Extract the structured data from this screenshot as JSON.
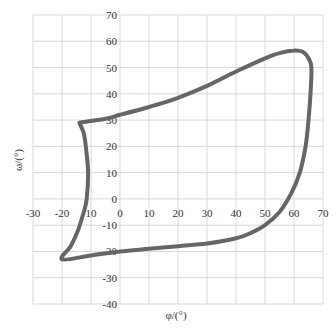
{
  "chart_data": {
    "type": "line",
    "title": "",
    "xlabel": "φ/(°)",
    "ylabel": "ω/(°)",
    "xlim": [
      -30,
      70
    ],
    "ylim": [
      -40,
      70
    ],
    "xticks": [
      -30,
      -20,
      -10,
      0,
      10,
      20,
      30,
      40,
      50,
      60,
      70
    ],
    "yticks": [
      -40,
      -30,
      -20,
      -10,
      0,
      10,
      20,
      30,
      40,
      50,
      60,
      70
    ],
    "xtick_labels": [
      "-30",
      "-20",
      "10",
      "0",
      "10",
      "20",
      "30",
      "40",
      "50",
      "60",
      "70"
    ],
    "ytick_labels": [
      "-40",
      "-30",
      "-20",
      "-10",
      "0",
      "10",
      "20",
      "30",
      "40",
      "50",
      "60",
      "70"
    ],
    "grid": true,
    "legend": null,
    "series": [
      {
        "name": "closed loop",
        "color": "#666666",
        "closed": true,
        "points": [
          [
            -14,
            29
          ],
          [
            -5,
            30.5
          ],
          [
            0,
            32
          ],
          [
            10,
            35
          ],
          [
            20,
            38.5
          ],
          [
            30,
            43
          ],
          [
            40,
            48.5
          ],
          [
            50,
            53.5
          ],
          [
            55,
            55.5
          ],
          [
            60,
            56.5
          ],
          [
            63,
            56
          ],
          [
            65,
            53.5
          ],
          [
            66,
            50
          ],
          [
            65.7,
            40
          ],
          [
            65,
            30
          ],
          [
            64,
            20
          ],
          [
            62,
            10
          ],
          [
            59,
            2
          ],
          [
            55,
            -5
          ],
          [
            50,
            -10
          ],
          [
            45,
            -13
          ],
          [
            40,
            -15
          ],
          [
            30,
            -17
          ],
          [
            20,
            -18
          ],
          [
            10,
            -19
          ],
          [
            0,
            -20
          ],
          [
            -10,
            -21.5
          ],
          [
            -20,
            -23
          ],
          [
            -17,
            -18
          ],
          [
            -14.5,
            -12
          ],
          [
            -12.5,
            -5
          ],
          [
            -11.5,
            0
          ],
          [
            -11,
            10
          ],
          [
            -11.8,
            20
          ],
          [
            -12.5,
            25
          ],
          [
            -14,
            29
          ]
        ]
      }
    ]
  }
}
